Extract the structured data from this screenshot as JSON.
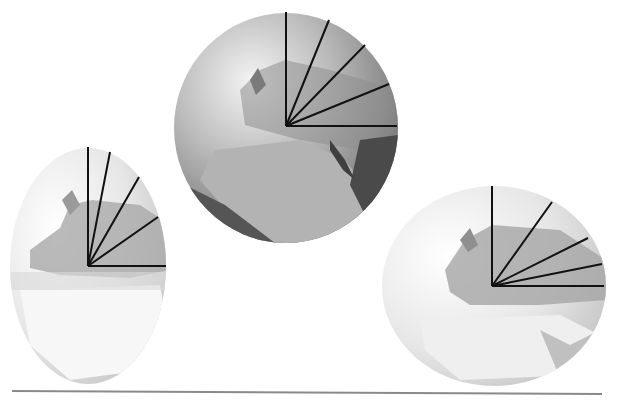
{
  "diagram": {
    "background": "#ffffff",
    "baseline": {
      "x1": 12,
      "y1": 391,
      "x2": 602,
      "y2": 394,
      "color": "#8a8a8a"
    },
    "globes": [
      {
        "id": "left-globe",
        "shape": "ellipse",
        "cx": 88,
        "cy": 266,
        "rx": 78,
        "ry": 118,
        "tone": "light",
        "origin": [
          88,
          266
        ],
        "rays": [
          [
            88,
            147
          ],
          [
            110,
            152
          ],
          [
            139,
            177
          ],
          [
            158,
            217
          ],
          [
            166,
            266
          ]
        ]
      },
      {
        "id": "center-globe",
        "shape": "circle",
        "cx": 286,
        "cy": 128,
        "rx": 112,
        "ry": 115,
        "tone": "dark",
        "origin": [
          286,
          126
        ],
        "rays": [
          [
            286,
            12
          ],
          [
            329,
            20
          ],
          [
            365,
            45
          ],
          [
            389,
            84
          ],
          [
            397,
            126
          ]
        ]
      },
      {
        "id": "right-globe",
        "shape": "ellipse",
        "cx": 494,
        "cy": 286,
        "rx": 112,
        "ry": 100,
        "tone": "light",
        "origin": [
          492,
          286
        ],
        "rays": [
          [
            492,
            186
          ],
          [
            552,
            202
          ],
          [
            588,
            238
          ],
          [
            602,
            264
          ],
          [
            604,
            286
          ]
        ]
      }
    ],
    "ray_color": "#111111"
  }
}
